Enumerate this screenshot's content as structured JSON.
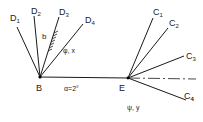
{
  "points": {
    "B": {
      "label": "B",
      "x": 40,
      "y": 77
    },
    "E": {
      "label": "E",
      "x": 128,
      "y": 78
    }
  },
  "d_lines": [
    {
      "name": "D1",
      "sub": "1",
      "x2": 17,
      "y2": 27,
      "lx": 10,
      "ly": 18
    },
    {
      "name": "D2",
      "sub": "2",
      "x2": 34,
      "y2": 16,
      "lx": 31,
      "ly": 11
    },
    {
      "name": "D3",
      "sub": "3",
      "x2": 59,
      "y2": 17,
      "lx": 60,
      "ly": 12
    },
    {
      "name": "D4",
      "sub": "4",
      "x2": 83,
      "y2": 24,
      "lx": 85,
      "ly": 20
    }
  ],
  "c_lines": [
    {
      "name": "C1",
      "sub": "1",
      "x2": 153,
      "y2": 18,
      "lx": 153,
      "ly": 12
    },
    {
      "name": "C2",
      "sub": "2",
      "x2": 168,
      "y2": 28,
      "lx": 169,
      "ly": 23
    },
    {
      "name": "C3",
      "sub": "3",
      "x2": 184,
      "y2": 56,
      "lx": 186,
      "ly": 56
    },
    {
      "name": "C4",
      "sub": "4",
      "x2": 186,
      "y2": 100,
      "lx": 184,
      "ly": 96
    }
  ],
  "labels": {
    "b": "b",
    "phi_x": "φ, x",
    "alpha": "α=2°",
    "psi_y": "ψ, y",
    "D": "D",
    "C": "C"
  },
  "colors": {
    "line": "#1a1a1a",
    "background": "#ffffff"
  }
}
